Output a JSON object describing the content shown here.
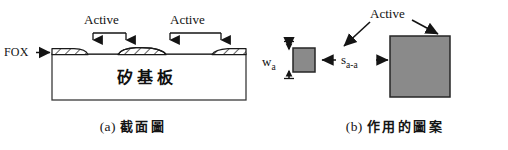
{
  "figure": {
    "panels": [
      {
        "id": "a",
        "caption_tag": "(a)",
        "caption_text": "截面圖",
        "labels": {
          "fox": "FOX",
          "active_left": "Active",
          "active_right": "Active",
          "substrate": "矽基板"
        },
        "elements": {
          "fox_region_count": 3,
          "active_bracket_count": 2
        }
      },
      {
        "id": "b",
        "caption_tag": "(b)",
        "caption_text": "作用的圖案",
        "labels": {
          "active": "Active",
          "width": "w",
          "width_sub": "a",
          "spacing": "s",
          "spacing_sub": "a-a"
        },
        "elements": {
          "active_pattern_count": 2
        }
      }
    ],
    "colors": {
      "line": "#1a1a1a",
      "active_fill": "#8a8a8a",
      "active_stroke": "#262626",
      "hatch": "#1a1a1a",
      "background": "#ffffff"
    }
  }
}
